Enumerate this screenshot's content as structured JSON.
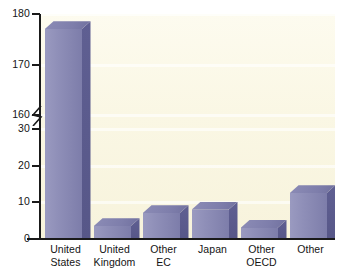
{
  "chart_data": {
    "type": "bar",
    "title": "",
    "subtitle": "",
    "xlabel": "",
    "ylabel": "",
    "categories": [
      "United States",
      "United Kingdom",
      "Other EC",
      "Japan",
      "Other OECD",
      "Other"
    ],
    "category_lines": [
      [
        "United",
        "States"
      ],
      [
        "United",
        "Kingdom"
      ],
      [
        "Other",
        "EC"
      ],
      [
        "Japan",
        ""
      ],
      [
        "Other",
        "OECD"
      ],
      [
        "Other",
        ""
      ]
    ],
    "values": [
      177,
      3.5,
      7,
      8,
      3,
      12.5
    ],
    "ylim": [
      0,
      180
    ],
    "y_axis_break": {
      "from": 30,
      "to": 160
    },
    "yticks": [
      0,
      10,
      20,
      30,
      160,
      170,
      180
    ],
    "ytick_labels": [
      "0",
      "10",
      "20",
      "30",
      "160",
      "170",
      "180"
    ],
    "grid": true,
    "legend": null,
    "colors": {
      "bar_front": "#8a8ab4",
      "bar_side": "#5a5a8c",
      "bar_top": "#7e7eab",
      "plot_background": "#faf7e4",
      "axis": "#1a1a1a",
      "text": "#141414"
    }
  }
}
